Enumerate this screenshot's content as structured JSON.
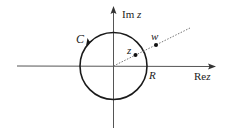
{
  "diagram": {
    "type": "complex-plane-contour",
    "colors": {
      "axis": "#555555",
      "circle": "#1a1a1a",
      "ray": "#666666",
      "point": "#111111",
      "text": "#222222"
    },
    "axes": {
      "real_label_prefix": "Re",
      "real_label_var": "z",
      "imag_label_prefix": "Im",
      "imag_label_var": "z"
    },
    "contour": {
      "label": "C",
      "orientation": "counter-clockwise",
      "radius_label": "R"
    },
    "points": [
      {
        "label": "z",
        "position": "inside circle on ray"
      },
      {
        "label": "w",
        "position": "outside circle on ray"
      }
    ],
    "ray": {
      "style": "dotted",
      "from": "origin"
    }
  }
}
